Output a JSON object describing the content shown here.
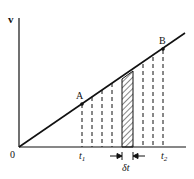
{
  "diagram": {
    "title": "",
    "axes": {
      "y_label": "v",
      "origin_label": "0"
    },
    "points": [
      {
        "name": "A",
        "label": "A"
      },
      {
        "name": "B",
        "label": "B"
      }
    ],
    "ticks": {
      "t1": "t",
      "t1_sub": "1",
      "t2": "t",
      "t2_sub": "2"
    },
    "interval_label": "δt",
    "colors": {
      "line": "#111111",
      "background": "#ffffff"
    }
  }
}
